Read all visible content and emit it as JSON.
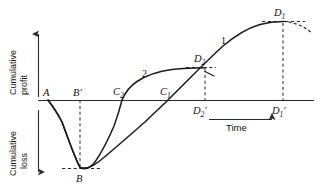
{
  "figure": {
    "background_color": "#ffffff",
    "line_color": "#1c1c1c"
  },
  "axes": {
    "y_upper_label_line1": "Cumulative",
    "y_upper_label_line2": "profit",
    "y_lower_label_line1": "Cumulative",
    "y_lower_label_line2": "loss",
    "x_label": "Time",
    "y_upper_arrow": "up-arrow",
    "y_lower_arrow": "down-arrow",
    "x_arrow": "right-arrow"
  },
  "curve_labels": {
    "curve1": "1",
    "curve2": "2"
  },
  "points": {
    "A": {
      "label": "A",
      "sub": ""
    },
    "B": {
      "label": "B",
      "sub": ""
    },
    "Bprime": {
      "label": "B",
      "sub": "",
      "prime": "′"
    },
    "C1": {
      "label": "C",
      "sub": "1"
    },
    "C2": {
      "label": "C",
      "sub": "2"
    },
    "D1": {
      "label": "D",
      "sub": "1"
    },
    "D1prime": {
      "label": "D",
      "sub": "1",
      "prime": "′"
    },
    "D2": {
      "label": "D",
      "sub": "2"
    },
    "D2prime": {
      "label": "D",
      "sub": "2",
      "prime": "′"
    }
  },
  "chart_data": {
    "type": "line",
    "xlabel": "Time",
    "ylabel": "Cumulative profit / Cumulative loss",
    "xlim": [
      0,
      318
    ],
    "ylim": [
      -1,
      1
    ],
    "grid": false,
    "legend": "inline curve numbers",
    "zero_axis_y": 100,
    "series": [
      {
        "name": "1",
        "description": "Slower-returning project: deeper/longer loss phase, breaks even later at C1, peaks highest at D1",
        "points": [
          {
            "x": 48,
            "y": 100,
            "label": "A"
          },
          {
            "x": 62,
            "y": 122
          },
          {
            "x": 72,
            "y": 148
          },
          {
            "x": 80,
            "y": 168,
            "label": "B"
          },
          {
            "x": 96,
            "y": 162
          },
          {
            "x": 120,
            "y": 145
          },
          {
            "x": 145,
            "y": 122
          },
          {
            "x": 168,
            "y": 100,
            "label": "C1"
          },
          {
            "x": 190,
            "y": 80
          },
          {
            "x": 215,
            "y": 55
          },
          {
            "x": 240,
            "y": 36
          },
          {
            "x": 262,
            "y": 26
          },
          {
            "x": 283,
            "y": 22,
            "label": "D1"
          }
        ],
        "dashed_tail": [
          {
            "x": 283,
            "y": 22
          },
          {
            "x": 298,
            "y": 25
          },
          {
            "x": 310,
            "y": 32
          }
        ]
      },
      {
        "name": "2",
        "description": "Faster-returning project: recovers quickly, breaks even at C2, plateaus at lower peak D2",
        "points": [
          {
            "x": 48,
            "y": 100,
            "label": "A"
          },
          {
            "x": 62,
            "y": 122
          },
          {
            "x": 72,
            "y": 148
          },
          {
            "x": 80,
            "y": 168,
            "label": "B"
          },
          {
            "x": 92,
            "y": 165
          },
          {
            "x": 104,
            "y": 150
          },
          {
            "x": 114,
            "y": 126
          },
          {
            "x": 122,
            "y": 100,
            "label": "C2"
          },
          {
            "x": 135,
            "y": 85
          },
          {
            "x": 152,
            "y": 75
          },
          {
            "x": 172,
            "y": 70
          },
          {
            "x": 190,
            "y": 68
          },
          {
            "x": 205,
            "y": 68,
            "label": "D2"
          }
        ]
      }
    ],
    "annotations": [
      {
        "name": "A",
        "x": 48,
        "y": 100,
        "text": "A",
        "note": "start of project on zero axis"
      },
      {
        "name": "B",
        "x": 80,
        "y": 168,
        "text": "B",
        "note": "maximum cumulative loss"
      },
      {
        "name": "B'",
        "x": 80,
        "y": 100,
        "text": "B′",
        "note": "time of maximum loss projected on axis"
      },
      {
        "name": "C2",
        "x": 122,
        "y": 100,
        "text": "C₂",
        "note": "break-even for curve 2"
      },
      {
        "name": "C1",
        "x": 168,
        "y": 100,
        "text": "C₁",
        "note": "break-even for curve 1"
      },
      {
        "name": "D2",
        "x": 205,
        "y": 68,
        "text": "D₂",
        "note": "maximum cumulative profit for curve 2"
      },
      {
        "name": "D2'",
        "x": 205,
        "y": 100,
        "text": "D₂′",
        "note": "time of D2 projected on axis"
      },
      {
        "name": "D1",
        "x": 283,
        "y": 22,
        "text": "D₁",
        "note": "maximum cumulative profit for curve 1"
      },
      {
        "name": "D1'",
        "x": 283,
        "y": 100,
        "text": "D₁′",
        "note": "time of D1 projected on axis"
      }
    ]
  }
}
